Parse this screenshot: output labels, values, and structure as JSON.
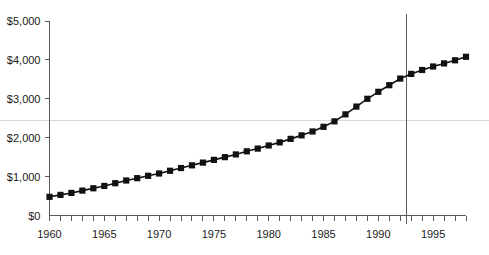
{
  "chart_data": {
    "type": "line",
    "title": "",
    "subtitle": "",
    "xlabel": "",
    "ylabel": "",
    "xlim": [
      1960,
      1998
    ],
    "ylim": [
      0,
      5000
    ],
    "grid": "single faint horizontal gridline near $2,450 spanning full image width",
    "legend_position": "none",
    "marker": "filled square",
    "line_color": "#111111",
    "marker_color": "#111111",
    "x": [
      1960,
      1961,
      1962,
      1963,
      1964,
      1965,
      1966,
      1967,
      1968,
      1969,
      1970,
      1971,
      1972,
      1973,
      1974,
      1975,
      1976,
      1977,
      1978,
      1979,
      1980,
      1981,
      1982,
      1983,
      1984,
      1985,
      1986,
      1987,
      1988,
      1989,
      1990,
      1991,
      1992,
      1993,
      1994,
      1995,
      1996,
      1997,
      1998
    ],
    "values": [
      480,
      530,
      580,
      640,
      700,
      760,
      830,
      900,
      960,
      1020,
      1080,
      1150,
      1220,
      1290,
      1360,
      1430,
      1500,
      1570,
      1650,
      1720,
      1800,
      1880,
      1970,
      2060,
      2160,
      2280,
      2420,
      2600,
      2800,
      3000,
      3180,
      3350,
      3520,
      3640,
      3740,
      3830,
      3910,
      3990,
      4080
    ],
    "ytick_values": [
      0,
      1000,
      2000,
      3000,
      4000,
      5000
    ],
    "ytick_labels": [
      "$0",
      "$1,000",
      "$2,000",
      "$3,000",
      "$4,000",
      "$5,000"
    ],
    "xtick_values": [
      1960,
      1961,
      1962,
      1963,
      1964,
      1965,
      1966,
      1967,
      1968,
      1969,
      1970,
      1971,
      1972,
      1973,
      1974,
      1975,
      1976,
      1977,
      1978,
      1979,
      1980,
      1981,
      1982,
      1983,
      1984,
      1985,
      1986,
      1987,
      1988,
      1989,
      1990,
      1991,
      1992,
      1993,
      1994,
      1995,
      1996,
      1997,
      1998
    ],
    "xtick_labeled_values": [
      1960,
      1965,
      1970,
      1975,
      1980,
      1985,
      1990,
      1995
    ],
    "xtick_labels": [
      "1960",
      "1965",
      "1970",
      "1975",
      "1980",
      "1985",
      "1990",
      "1995"
    ],
    "annotations": [
      {
        "type": "vertical-reference-line",
        "x": 1992.6,
        "label": "",
        "color": "#5a5a5a"
      }
    ]
  }
}
